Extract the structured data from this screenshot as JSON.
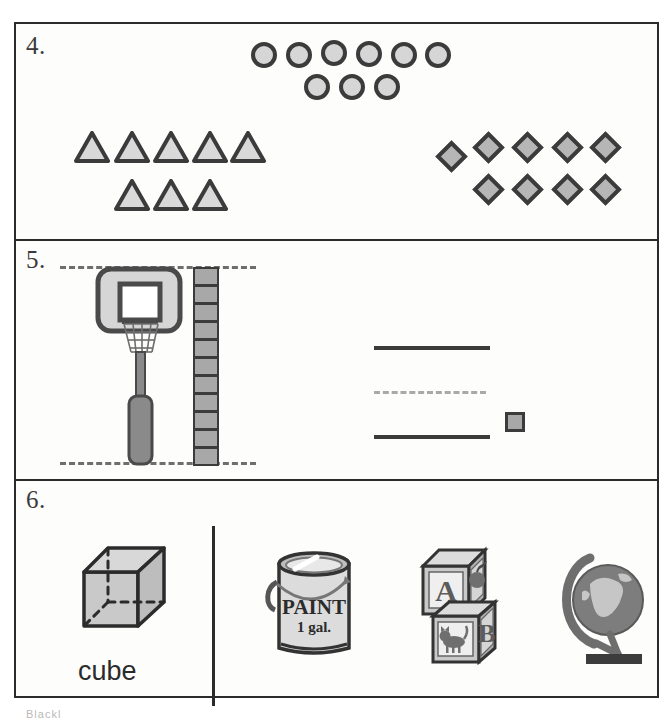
{
  "worksheet": {
    "footer_text": "Blackl"
  },
  "sections": [
    {
      "number": "4.",
      "groups": [
        {
          "name": "circles",
          "shape": "circle",
          "rows": [
            6,
            3
          ],
          "total": 9
        },
        {
          "name": "triangles",
          "shape": "triangle",
          "rows": [
            5,
            3
          ],
          "total": 8
        },
        {
          "name": "diamonds",
          "shape": "diamond",
          "rows": [
            5,
            4
          ],
          "total": 9
        }
      ]
    },
    {
      "number": "5.",
      "left": {
        "object": "basketball-hoop",
        "measure_tower_cubes": 11,
        "top_guide": "dashed",
        "bottom_guide": "dashed"
      },
      "right": {
        "top_line": "solid",
        "middle_line": "dashed",
        "bottom_line": "solid",
        "unit_cube": 1
      }
    },
    {
      "number": "6.",
      "left": {
        "shape_name": "cube",
        "label": "cube"
      },
      "objects": [
        {
          "name": "paint-can",
          "line1": "PAINT",
          "line2": "1 gal."
        },
        {
          "name": "alphabet-blocks",
          "top_letter": "A",
          "top_picture": "apple",
          "bottom_letter": "B",
          "bottom_picture": "cat"
        },
        {
          "name": "globe",
          "picture": "world-globe-on-stand"
        }
      ]
    }
  ],
  "colors": {
    "ink": "#2b2b2b",
    "shape_fill": "#d6d6d6",
    "diamond_fill": "#b6b6b6",
    "cube_fill": "#a8a8a8",
    "guide": "#6e6e6e"
  }
}
